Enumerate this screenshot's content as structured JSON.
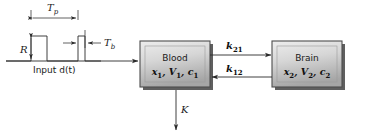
{
  "diagram": {
    "input_signal": {
      "caption": "Input d(t)",
      "amplitude_label": "R",
      "period_label": "T",
      "period_sub": "p",
      "pulse_width_label": "T",
      "pulse_width_sub": "b"
    },
    "blocks": [
      {
        "id": "blood",
        "name": "Blood",
        "vars_main": "x",
        "vars_line": "x1, V1, c1",
        "state": "x",
        "state_sub": "1",
        "volume": "V",
        "volume_sub": "1",
        "concentration": "c",
        "conc_sub": "1"
      },
      {
        "id": "brain",
        "name": "Brain",
        "vars_line": "x2, V2, c2",
        "state": "x",
        "state_sub": "2",
        "volume": "V",
        "volume_sub": "2",
        "concentration": "c",
        "conc_sub": "2"
      }
    ],
    "flows": [
      {
        "id": "k21",
        "label": "k",
        "sub": "21",
        "direction": "blood-to-brain"
      },
      {
        "id": "k12",
        "label": "k",
        "sub": "12",
        "direction": "brain-to-blood"
      },
      {
        "id": "K",
        "label": "K",
        "sub": "",
        "direction": "elimination-down"
      }
    ],
    "colors": {
      "line": "#2a2a2a",
      "box_border": "#4a4a4a",
      "box_fill_light": "#e6e6e6",
      "box_fill_dark": "#a9a9a9",
      "box_shadow": "#585858",
      "text": "#1a1a1a"
    }
  }
}
